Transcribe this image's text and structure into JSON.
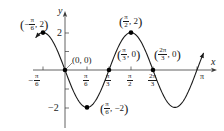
{
  "chart_data": {
    "type": "line",
    "function": "y = -2 sin(3x)",
    "title": "",
    "xlabel": "x",
    "ylabel": "y",
    "xlim": [
      -0.92,
      3.42
    ],
    "ylim": [
      -3.1,
      3.1
    ],
    "grid": false,
    "legend": null,
    "x_ticks": [
      {
        "value": -0.5236,
        "label_num": "π",
        "label_den": "6",
        "sign": "−"
      },
      {
        "value": 0.5236,
        "label_num": "π",
        "label_den": "6",
        "sign": ""
      },
      {
        "value": 1.0472,
        "label_num": "π",
        "label_den": "3",
        "sign": ""
      },
      {
        "value": 1.5708,
        "label_num": "π",
        "label_den": "2",
        "sign": ""
      },
      {
        "value": 2.0944,
        "label_num": "2π",
        "label_den": "3",
        "sign": ""
      },
      {
        "value": 3.1416,
        "label": "π"
      }
    ],
    "y_ticks": [
      {
        "value": 2,
        "label": "2"
      },
      {
        "value": 1,
        "label": ""
      },
      {
        "value": -1,
        "label": ""
      },
      {
        "value": -2,
        "label": "−2"
      }
    ],
    "points": [
      {
        "x": -0.5236,
        "y": 2,
        "label": "(−π/6, 2)"
      },
      {
        "x": 0,
        "y": 0,
        "label": "(0, 0)"
      },
      {
        "x": 0.5236,
        "y": -2,
        "label": "(π/6, −2)"
      },
      {
        "x": 1.0472,
        "y": 0,
        "label": "(π/3, 0)"
      },
      {
        "x": 1.5708,
        "y": 2,
        "label": "(π/2, 2)"
      },
      {
        "x": 2.0944,
        "y": 0,
        "label": "(2π/3, 0)"
      }
    ],
    "curve_domain": [
      -0.7,
      3.3
    ]
  },
  "axes": {
    "x_label": "x",
    "y_label": "y"
  },
  "tick_labels": {
    "y2": "2",
    "yneg2": "−2",
    "xpi": "π",
    "neg_sign": "−",
    "pi": "π",
    "twopi": "2π",
    "d6": "6",
    "d3": "3",
    "d2": "2"
  },
  "point_labels": {
    "p1": {
      "pre": "(",
      "sign": "−",
      "num": "π",
      "den": "6",
      "post": ", 2)"
    },
    "p2": {
      "text": "(0, 0)"
    },
    "p3": {
      "pre": "(",
      "num": "π",
      "den": "6",
      "post": ", −2)"
    },
    "p4": {
      "pre": "(",
      "num": "π",
      "den": "3",
      "post": ", 0)"
    },
    "p5": {
      "pre": "(",
      "num": "π",
      "den": "2",
      "post": ", 2)"
    },
    "p6": {
      "pre": "(",
      "num": "2π",
      "den": "3",
      "post": ", 0)"
    }
  },
  "colors": {
    "curve": "#1a1a1a",
    "axes": "#3a3a3a",
    "points": "#000000"
  }
}
